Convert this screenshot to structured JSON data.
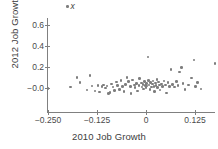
{
  "chart_data": {
    "type": "scatter",
    "title": "",
    "xlabel": "2010 Job Growth",
    "ylabel": "2012 Job Growth",
    "xticks": [
      "−0.250",
      "−0.125",
      "0",
      "0.125"
    ],
    "xtick_values": [
      -0.25,
      -0.125,
      0,
      0.125
    ],
    "yticks": [
      "0.6",
      "0.4",
      "0.2",
      "−0.0"
    ],
    "ytick_values": [
      0.6,
      0.4,
      0.2,
      0.0
    ],
    "xlim": [
      -0.28,
      0.205
    ],
    "ylim": [
      -0.085,
      0.72
    ],
    "grid": false,
    "legend": "none",
    "marker_color": "#7d7d7d",
    "axis_color": "#808080",
    "annotation": {
      "marker": "dot",
      "text": "x"
    },
    "points": [
      [
        -0.25,
        -0.005
      ],
      [
        -0.192,
        0.01
      ],
      [
        -0.176,
        0.1
      ],
      [
        -0.168,
        0.052
      ],
      [
        -0.15,
        -0.018
      ],
      [
        -0.143,
        0.118
      ],
      [
        -0.138,
        0.02
      ],
      [
        -0.13,
        -0.03
      ],
      [
        -0.122,
        0.022
      ],
      [
        -0.118,
        -0.04
      ],
      [
        -0.112,
        0.012
      ],
      [
        -0.108,
        0.03
      ],
      [
        -0.104,
        0.0
      ],
      [
        -0.1,
        0.018
      ],
      [
        -0.096,
        -0.05
      ],
      [
        -0.092,
        -0.045
      ],
      [
        -0.088,
        0.04
      ],
      [
        -0.084,
        0.008
      ],
      [
        -0.08,
        -0.022
      ],
      [
        -0.076,
        0.058
      ],
      [
        -0.072,
        0.026
      ],
      [
        -0.068,
        -0.012
      ],
      [
        -0.064,
        0.07
      ],
      [
        -0.06,
        0.012
      ],
      [
        -0.056,
        -0.035
      ],
      [
        -0.052,
        0.036
      ],
      [
        -0.048,
        0.098
      ],
      [
        -0.044,
        0.06
      ],
      [
        -0.04,
        0.016
      ],
      [
        -0.038,
        -0.052
      ],
      [
        -0.034,
        0.078
      ],
      [
        -0.03,
        0.03
      ],
      [
        -0.028,
        0.006
      ],
      [
        -0.024,
        0.042
      ],
      [
        -0.022,
        -0.028
      ],
      [
        -0.018,
        0.022
      ],
      [
        -0.016,
        0.088
      ],
      [
        -0.012,
        0.048
      ],
      [
        -0.01,
        0.01
      ],
      [
        -0.008,
        0.034
      ],
      [
        -0.006,
        -0.008
      ],
      [
        -0.004,
        0.062
      ],
      [
        -0.002,
        0.026
      ],
      [
        0.0,
        0.002
      ],
      [
        0.001,
        0.044
      ],
      [
        0.003,
        0.018
      ],
      [
        0.005,
        0.296
      ],
      [
        0.006,
        0.072
      ],
      [
        0.008,
        0.03
      ],
      [
        0.01,
        -0.016
      ],
      [
        0.012,
        0.052
      ],
      [
        0.014,
        0.008
      ],
      [
        0.016,
        0.038
      ],
      [
        0.018,
        0.066
      ],
      [
        0.02,
        0.014
      ],
      [
        0.022,
        -0.036
      ],
      [
        0.024,
        0.046
      ],
      [
        0.026,
        0.024
      ],
      [
        0.028,
        0.08
      ],
      [
        0.03,
        0.004
      ],
      [
        0.032,
        0.058
      ],
      [
        0.034,
        0.03
      ],
      [
        0.036,
        -0.02
      ],
      [
        0.04,
        0.04
      ],
      [
        0.042,
        0.012
      ],
      [
        0.046,
        0.068
      ],
      [
        0.05,
        0.028
      ],
      [
        0.052,
        -0.048
      ],
      [
        0.056,
        0.05
      ],
      [
        0.06,
        0.016
      ],
      [
        0.064,
        0.176
      ],
      [
        0.068,
        0.034
      ],
      [
        0.072,
        0.008
      ],
      [
        0.078,
        0.06
      ],
      [
        0.082,
        0.022
      ],
      [
        0.086,
        0.152
      ],
      [
        0.09,
        0.196
      ],
      [
        0.094,
        0.042
      ],
      [
        0.1,
        -0.014
      ],
      [
        0.108,
        0.03
      ],
      [
        0.116,
        0.096
      ],
      [
        0.122,
        0.268
      ],
      [
        0.126,
        0.012
      ],
      [
        0.132,
        0.05
      ],
      [
        0.14,
        -0.01
      ],
      [
        0.176,
        0.232
      ],
      [
        0.196,
        0.09
      ]
    ]
  }
}
